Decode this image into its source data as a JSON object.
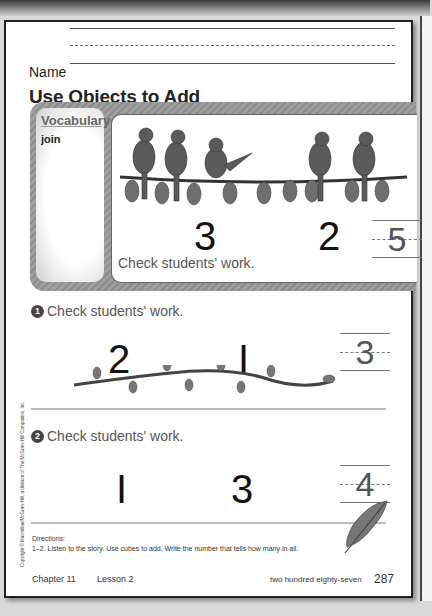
{
  "page": {
    "name_label": "Name",
    "title": "Use Objects to Add",
    "vocabulary": {
      "heading": "Vocabulary",
      "word": "join"
    },
    "intro": {
      "left_number": "3",
      "right_number": "2",
      "answer": "5",
      "note": "Check students' work."
    },
    "exercises": [
      {
        "badge": "1",
        "note": "Check students' work.",
        "left_number": "2",
        "right_number": "I",
        "answer": "3"
      },
      {
        "badge": "2",
        "note": "Check students' work.",
        "left_number": "I",
        "right_number": "3",
        "answer": "4"
      }
    ],
    "copyright": "Copyright © Macmillan/McGraw-Hill, a division of The McGraw-Hill Companies, Inc.",
    "directions": {
      "heading": "Directions:",
      "text": "1–2. Listen to the story. Use cubes to add. Write the number that tells how many in all."
    },
    "footer": {
      "chapter": "Chapter 11",
      "lesson": "Lesson 2",
      "page_words": "two hundred eighty-seven",
      "page_number": "287"
    },
    "colors": {
      "banner": "#969696",
      "bird": "#5a5a5a",
      "leaf": "#777777",
      "answer_text": "#555555"
    }
  }
}
